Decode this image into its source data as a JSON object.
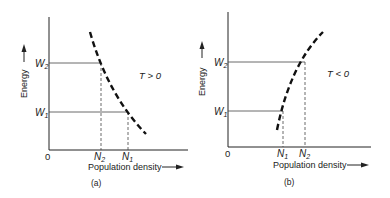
{
  "panels": [
    {
      "id": "a",
      "caption": "(a)",
      "y_axis_label": "Energy",
      "x_axis_label": "Population density",
      "origin_label": "0",
      "condition": "T > 0",
      "levels": [
        {
          "name": "W",
          "sub": "2",
          "density": "N",
          "density_sub": "2"
        },
        {
          "name": "W",
          "sub": "1",
          "density": "N",
          "density_sub": "1"
        }
      ],
      "curve": "decreasing"
    },
    {
      "id": "b",
      "caption": "(b)",
      "y_axis_label": "Energy",
      "x_axis_label": "Population density",
      "origin_label": "0",
      "condition": "T < 0",
      "levels": [
        {
          "name": "W",
          "sub": "2",
          "density": "N",
          "density_sub": "2"
        },
        {
          "name": "W",
          "sub": "1",
          "density": "N",
          "density_sub": "1"
        }
      ],
      "curve": "increasing"
    }
  ],
  "colors": {
    "ink": "#222222",
    "background": "#ffffff"
  }
}
